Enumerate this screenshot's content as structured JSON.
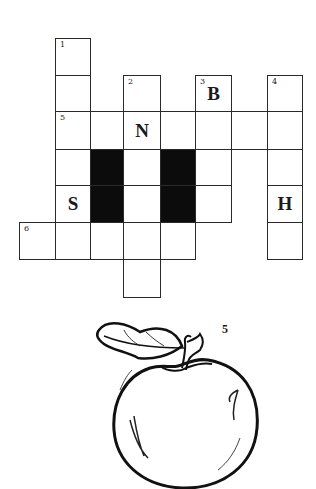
{
  "puzzle": {
    "type": "crossword",
    "columns_px": [
      19,
      55,
      90,
      123,
      160,
      195,
      231,
      267,
      302
    ],
    "rows_px": [
      38,
      75,
      111,
      149,
      185,
      222,
      259,
      297
    ],
    "cells": [
      {
        "col": 1,
        "row": 0,
        "number": "1",
        "letter": ""
      },
      {
        "col": 1,
        "row": 1,
        "number": "",
        "letter": ""
      },
      {
        "col": 1,
        "row": 2,
        "number": "5",
        "letter": ""
      },
      {
        "col": 1,
        "row": 3,
        "number": "",
        "letter": ""
      },
      {
        "col": 1,
        "row": 4,
        "number": "",
        "letter": "S"
      },
      {
        "col": 2,
        "row": 2,
        "number": "",
        "letter": ""
      },
      {
        "col": 2,
        "row": 3,
        "number": "",
        "letter": "",
        "block": true
      },
      {
        "col": 2,
        "row": 4,
        "number": "",
        "letter": "",
        "block": true
      },
      {
        "col": 3,
        "row": 1,
        "number": "2",
        "letter": ""
      },
      {
        "col": 3,
        "row": 2,
        "number": "",
        "letter": "N"
      },
      {
        "col": 3,
        "row": 3,
        "number": "",
        "letter": ""
      },
      {
        "col": 3,
        "row": 4,
        "number": "",
        "letter": ""
      },
      {
        "col": 3,
        "row": 5,
        "number": "",
        "letter": ""
      },
      {
        "col": 3,
        "row": 6,
        "number": "",
        "letter": ""
      },
      {
        "col": 4,
        "row": 2,
        "number": "",
        "letter": ""
      },
      {
        "col": 4,
        "row": 3,
        "number": "",
        "letter": "",
        "block": true
      },
      {
        "col": 4,
        "row": 4,
        "number": "",
        "letter": "",
        "block": true
      },
      {
        "col": 5,
        "row": 1,
        "number": "3",
        "letter": "B"
      },
      {
        "col": 5,
        "row": 2,
        "number": "",
        "letter": ""
      },
      {
        "col": 5,
        "row": 3,
        "number": "",
        "letter": ""
      },
      {
        "col": 5,
        "row": 4,
        "number": "",
        "letter": ""
      },
      {
        "col": 6,
        "row": 2,
        "number": "",
        "letter": ""
      },
      {
        "col": 7,
        "row": 1,
        "number": "4",
        "letter": ""
      },
      {
        "col": 7,
        "row": 2,
        "number": "",
        "letter": ""
      },
      {
        "col": 7,
        "row": 3,
        "number": "",
        "letter": ""
      },
      {
        "col": 7,
        "row": 4,
        "number": "",
        "letter": "H"
      },
      {
        "col": 7,
        "row": 5,
        "number": "",
        "letter": ""
      },
      {
        "col": 0,
        "row": 5,
        "number": "6",
        "letter": ""
      },
      {
        "col": 1,
        "row": 5,
        "number": "",
        "letter": ""
      },
      {
        "col": 2,
        "row": 5,
        "number": "",
        "letter": ""
      },
      {
        "col": 4,
        "row": 5,
        "number": "",
        "letter": ""
      }
    ]
  },
  "picture_clue": {
    "number": "5",
    "image": "apple-icon"
  }
}
